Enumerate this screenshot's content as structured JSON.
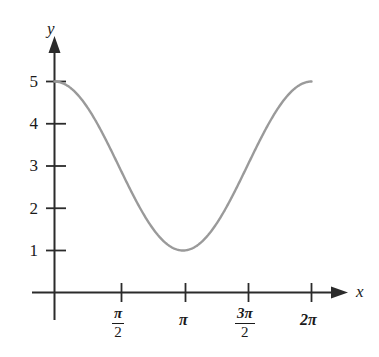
{
  "figure": {
    "background": "#ffffff",
    "axis_color": "#2b2b2b",
    "curve_color": "#9a9a9a",
    "text_color": "#1a1a1a"
  },
  "labels": {
    "x_axis": "x",
    "y_axis": "y"
  },
  "y_ticks": [
    {
      "value": 1,
      "label": "1"
    },
    {
      "value": 2,
      "label": "2"
    },
    {
      "value": 3,
      "label": "3"
    },
    {
      "value": 4,
      "label": "4"
    },
    {
      "value": 5,
      "label": "5"
    }
  ],
  "x_ticks": [
    {
      "value": 1.5707963,
      "label": "π/2",
      "numerator": "π",
      "denominator": "2",
      "is_fraction": true
    },
    {
      "value": 3.1415927,
      "label": "π",
      "is_fraction": false
    },
    {
      "value": 4.712389,
      "label": "3π/2",
      "numerator": "3π",
      "denominator": "2",
      "is_fraction": true
    },
    {
      "value": 6.2831853,
      "label": "2π",
      "is_fraction": false
    }
  ],
  "chart_data": {
    "type": "line",
    "title": "",
    "subtitle": "",
    "xlabel": "x",
    "ylabel": "y",
    "xlim": [
      0,
      6.2831853
    ],
    "ylim": [
      0,
      5.6
    ],
    "grid": false,
    "legend": null,
    "axis_style": "arrow-headed single line axes (no box, no gridlines)",
    "series": [
      {
        "name": "y = 2cos(x) + 3",
        "color": "#9a9a9a",
        "linewidth": 2,
        "x": [
          0,
          0.3141593,
          0.6283185,
          0.9424778,
          1.2566371,
          1.5707963,
          1.8849556,
          2.1991149,
          2.5132741,
          2.8274334,
          3.1415927,
          3.4557519,
          3.7699112,
          4.0840704,
          4.3982297,
          4.712389,
          5.0265482,
          5.3407075,
          5.6548668,
          5.969026,
          6.2831853
        ],
        "y": [
          5.0,
          4.9021,
          4.618,
          4.1756,
          3.618,
          3.0,
          2.382,
          1.8244,
          1.382,
          1.0979,
          1.0,
          1.0979,
          1.382,
          1.8244,
          2.382,
          3.0,
          3.618,
          4.1756,
          4.618,
          4.9021,
          5.0
        ]
      }
    ],
    "annotations": [
      {
        "text": "maximum at x = 0, y = 5"
      },
      {
        "text": "minimum at x = π, y = 1"
      },
      {
        "text": "maximum at x = 2π, y = 5"
      }
    ],
    "x_tick_values": [
      1.5707963,
      3.1415927,
      4.712389,
      6.2831853
    ],
    "x_tick_labels": [
      "π/2",
      "π",
      "3π/2",
      "2π"
    ],
    "y_tick_values": [
      1,
      2,
      3,
      4,
      5
    ],
    "y_tick_labels": [
      "1",
      "2",
      "3",
      "4",
      "5"
    ]
  }
}
